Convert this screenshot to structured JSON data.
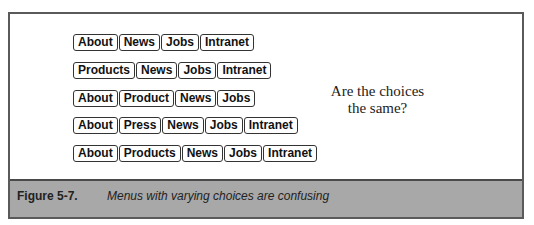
{
  "figure": {
    "menus": [
      {
        "items": [
          "About",
          "News",
          "Jobs",
          "Intranet"
        ]
      },
      {
        "items": [
          "Products",
          "News",
          "Jobs",
          "Intranet"
        ]
      },
      {
        "items": [
          "About",
          "Product",
          "News",
          "Jobs"
        ]
      },
      {
        "items": [
          "About",
          "Press",
          "News",
          "Jobs",
          "Intranet"
        ]
      },
      {
        "items": [
          "About",
          "Products",
          "News",
          "Jobs",
          "Intranet"
        ]
      }
    ],
    "question_line1": "Are the choices",
    "question_line2": "the same?",
    "caption_label": "Figure 5-7.",
    "caption_text": "Menus with varying choices are confusing"
  }
}
